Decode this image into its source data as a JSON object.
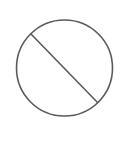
{
  "symbol": {
    "name": "prohibited-symbol",
    "stroke_color": "#5a5a5a",
    "background": "#ffffff",
    "circle": {
      "cx": 64.5,
      "cy": 68,
      "r": 48
    },
    "slash": {
      "x1": 31,
      "y1": 34,
      "x2": 98,
      "y2": 103
    }
  }
}
